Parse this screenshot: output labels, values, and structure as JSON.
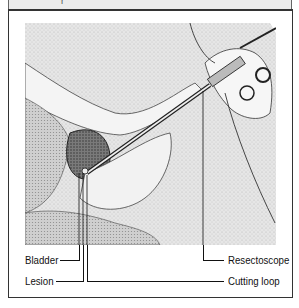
{
  "header": {
    "partial_text": "r"
  },
  "figure": {
    "labels": {
      "bladder": "Bladder",
      "lesion": "Lesion",
      "resectoscope": "Resectoscope",
      "cutting_loop": "Cutting loop"
    }
  },
  "colors": {
    "frame": "#333333",
    "header_band": "#ececec",
    "stipple": "#d8d8d8",
    "ink": "#1a1a1a"
  }
}
